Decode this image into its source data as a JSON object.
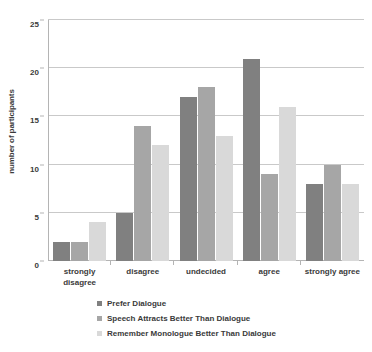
{
  "chart_data": {
    "type": "bar",
    "title": "",
    "xlabel": "",
    "ylabel": "number of participants",
    "ylim": [
      0,
      25
    ],
    "yticks": [
      0,
      5,
      10,
      15,
      20,
      25
    ],
    "grid": true,
    "legend_position": "bottom",
    "categories": [
      "strongly\ndisagree",
      "disagree",
      "undecided",
      "agree",
      "strongly agree"
    ],
    "category_labels": [
      [
        "strongly",
        "disagree"
      ],
      [
        "disagree",
        ""
      ],
      [
        "undecided",
        ""
      ],
      [
        "agree",
        ""
      ],
      [
        "strongly agree",
        ""
      ]
    ],
    "series": [
      {
        "name": "Prefer Dialogue",
        "color": "#808080",
        "values": [
          2,
          5,
          17,
          21,
          8
        ]
      },
      {
        "name": "Speech Attracts Better Than Dialogue",
        "color": "#a6a6a6",
        "values": [
          2,
          14,
          18,
          9,
          10
        ]
      },
      {
        "name": "Remember Monologue Better Than Dialogue",
        "color": "#d9d9d9",
        "values": [
          4,
          12,
          13,
          16,
          8
        ]
      }
    ]
  },
  "axis": {
    "y_title": "number of participants",
    "tick_0": "0",
    "tick_5": "5",
    "tick_10": "10",
    "tick_15": "15",
    "tick_20": "20",
    "tick_25": "25"
  },
  "legend": {
    "items": [
      {
        "label": "Prefer Dialogue",
        "color": "#808080"
      },
      {
        "label": "Speech Attracts Better Than Dialogue",
        "color": "#a6a6a6"
      },
      {
        "label": "Remember Monologue Better Than Dialogue",
        "color": "#d9d9d9"
      }
    ]
  }
}
